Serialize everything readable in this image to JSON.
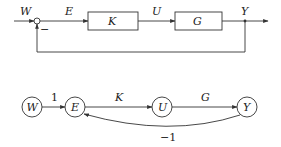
{
  "block_diagram": {
    "input_label": "W",
    "error_label": "E",
    "control_label": "U",
    "output_label": "Y",
    "minus_sign": "−",
    "blocks": [
      {
        "id": "K",
        "label": "K"
      },
      {
        "id": "G",
        "label": "G"
      }
    ]
  },
  "signal_flow_graph": {
    "nodes": [
      {
        "id": "W",
        "label": "W"
      },
      {
        "id": "E",
        "label": "E"
      },
      {
        "id": "U",
        "label": "U"
      },
      {
        "id": "Y",
        "label": "Y"
      }
    ],
    "edges": [
      {
        "from": "W",
        "to": "E",
        "label": "1"
      },
      {
        "from": "E",
        "to": "U",
        "label": "K"
      },
      {
        "from": "U",
        "to": "Y",
        "label": "G"
      },
      {
        "from": "Y",
        "to": "E",
        "label": "−1"
      }
    ]
  },
  "colors": {
    "line": "#333333",
    "text": "#222222",
    "background": "#ffffff"
  }
}
